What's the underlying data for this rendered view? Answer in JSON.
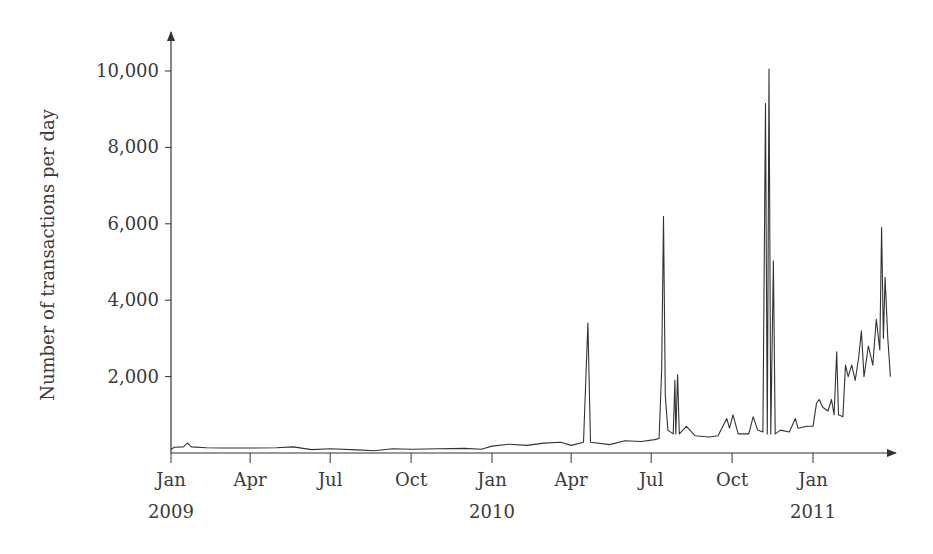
{
  "chart_data": {
    "type": "line",
    "title": "",
    "xlabel": "",
    "ylabel": "Number of transactions per day",
    "ylim": [
      0,
      10800
    ],
    "xlim": [
      "2009-01-01",
      "2011-04-30"
    ],
    "grid": false,
    "legend": null,
    "y_ticks": [
      {
        "value": 2000,
        "label": "2,000"
      },
      {
        "value": 4000,
        "label": "4,000"
      },
      {
        "value": 6000,
        "label": "6,000"
      },
      {
        "value": 8000,
        "label": "8,000"
      },
      {
        "value": 10000,
        "label": "10,000"
      }
    ],
    "x_ticks": [
      {
        "date": "2009-01-01",
        "label": "Jan",
        "year": "2009"
      },
      {
        "date": "2009-04-01",
        "label": "Apr",
        "year": ""
      },
      {
        "date": "2009-07-01",
        "label": "Jul",
        "year": ""
      },
      {
        "date": "2009-10-01",
        "label": "Oct",
        "year": ""
      },
      {
        "date": "2010-01-01",
        "label": "Jan",
        "year": "2010"
      },
      {
        "date": "2010-04-01",
        "label": "Apr",
        "year": ""
      },
      {
        "date": "2010-07-01",
        "label": "Jul",
        "year": ""
      },
      {
        "date": "2010-10-01",
        "label": "Oct",
        "year": ""
      },
      {
        "date": "2011-01-01",
        "label": "Jan",
        "year": "2011"
      }
    ],
    "series": [
      {
        "name": "Transactions per day",
        "color": "#333333",
        "points": [
          [
            "2009-01-01",
            100
          ],
          [
            "2009-01-05",
            150
          ],
          [
            "2009-01-15",
            160
          ],
          [
            "2009-01-20",
            260
          ],
          [
            "2009-01-24",
            160
          ],
          [
            "2009-02-10",
            140
          ],
          [
            "2009-03-01",
            130
          ],
          [
            "2009-04-01",
            130
          ],
          [
            "2009-05-01",
            140
          ],
          [
            "2009-05-20",
            160
          ],
          [
            "2009-06-10",
            90
          ],
          [
            "2009-07-01",
            110
          ],
          [
            "2009-08-01",
            80
          ],
          [
            "2009-08-20",
            60
          ],
          [
            "2009-09-10",
            110
          ],
          [
            "2009-10-01",
            100
          ],
          [
            "2009-11-01",
            110
          ],
          [
            "2009-12-01",
            120
          ],
          [
            "2009-12-20",
            100
          ],
          [
            "2010-01-01",
            180
          ],
          [
            "2010-01-20",
            230
          ],
          [
            "2010-02-10",
            200
          ],
          [
            "2010-03-01",
            260
          ],
          [
            "2010-03-20",
            280
          ],
          [
            "2010-04-01",
            200
          ],
          [
            "2010-04-15",
            280
          ],
          [
            "2010-04-20",
            3400
          ],
          [
            "2010-04-23",
            280
          ],
          [
            "2010-05-15",
            220
          ],
          [
            "2010-06-01",
            320
          ],
          [
            "2010-06-20",
            300
          ],
          [
            "2010-07-05",
            350
          ],
          [
            "2010-07-10",
            380
          ],
          [
            "2010-07-13",
            2200
          ],
          [
            "2010-07-15",
            6200
          ],
          [
            "2010-07-17",
            1500
          ],
          [
            "2010-07-20",
            600
          ],
          [
            "2010-07-26",
            500
          ],
          [
            "2010-07-28",
            1900
          ],
          [
            "2010-07-29",
            500
          ],
          [
            "2010-07-31",
            2050
          ],
          [
            "2010-08-02",
            500
          ],
          [
            "2010-08-10",
            700
          ],
          [
            "2010-08-20",
            450
          ],
          [
            "2010-09-05",
            420
          ],
          [
            "2010-09-15",
            450
          ],
          [
            "2010-09-25",
            900
          ],
          [
            "2010-09-28",
            650
          ],
          [
            "2010-10-02",
            1000
          ],
          [
            "2010-10-08",
            500
          ],
          [
            "2010-10-20",
            500
          ],
          [
            "2010-10-25",
            950
          ],
          [
            "2010-10-30",
            600
          ],
          [
            "2010-11-05",
            550
          ],
          [
            "2010-11-08",
            9150
          ],
          [
            "2010-11-10",
            500
          ],
          [
            "2010-11-12",
            10050
          ],
          [
            "2010-11-14",
            500
          ],
          [
            "2010-11-17",
            5030
          ],
          [
            "2010-11-19",
            500
          ],
          [
            "2010-11-25",
            600
          ],
          [
            "2010-12-05",
            550
          ],
          [
            "2010-12-12",
            900
          ],
          [
            "2010-12-15",
            650
          ],
          [
            "2010-12-25",
            700
          ],
          [
            "2011-01-01",
            700
          ],
          [
            "2011-01-05",
            1300
          ],
          [
            "2011-01-08",
            1400
          ],
          [
            "2011-01-12",
            1200
          ],
          [
            "2011-01-18",
            1100
          ],
          [
            "2011-01-22",
            1400
          ],
          [
            "2011-01-25",
            1000
          ],
          [
            "2011-01-28",
            2650
          ],
          [
            "2011-01-30",
            1000
          ],
          [
            "2011-02-04",
            950
          ],
          [
            "2011-02-07",
            2300
          ],
          [
            "2011-02-10",
            2000
          ],
          [
            "2011-02-14",
            2300
          ],
          [
            "2011-02-18",
            1900
          ],
          [
            "2011-02-22",
            2500
          ],
          [
            "2011-02-25",
            3200
          ],
          [
            "2011-02-28",
            2000
          ],
          [
            "2011-03-05",
            2800
          ],
          [
            "2011-03-10",
            2300
          ],
          [
            "2011-03-14",
            3500
          ],
          [
            "2011-03-18",
            2700
          ],
          [
            "2011-03-20",
            5900
          ],
          [
            "2011-03-22",
            3000
          ],
          [
            "2011-03-24",
            4600
          ],
          [
            "2011-03-27",
            3000
          ],
          [
            "2011-03-30",
            2000
          ]
        ]
      }
    ]
  }
}
